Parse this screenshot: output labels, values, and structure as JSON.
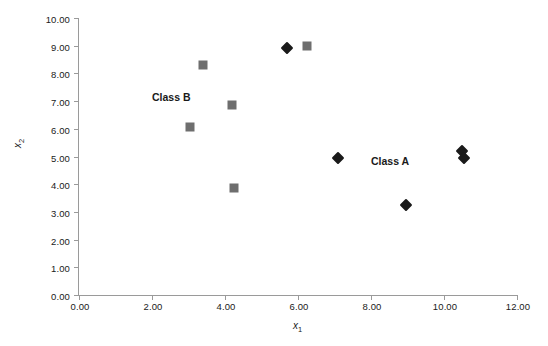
{
  "chart_data": {
    "type": "scatter",
    "title": "",
    "xlabel": "x1",
    "ylabel": "x2",
    "xlim": [
      0,
      12
    ],
    "ylim": [
      0,
      10
    ],
    "grid": false,
    "legend_position": "inline-annotations",
    "xticks": [
      "0.00",
      "2.00",
      "4.00",
      "6.00",
      "8.00",
      "10.00",
      "12.00"
    ],
    "xtick_values": [
      0,
      2,
      4,
      6,
      8,
      10,
      12
    ],
    "yticks": [
      "0.00",
      "1.00",
      "2.00",
      "3.00",
      "4.00",
      "5.00",
      "6.00",
      "7.00",
      "8.00",
      "9.00",
      "10.00"
    ],
    "ytick_values": [
      0,
      1,
      2,
      3,
      4,
      5,
      6,
      7,
      8,
      9,
      10
    ],
    "series": [
      {
        "name": "Class A",
        "marker": "diamond",
        "color": "#1a1a1a",
        "points": [
          {
            "x": 5.7,
            "y": 8.9
          },
          {
            "x": 7.1,
            "y": 4.95
          },
          {
            "x": 8.95,
            "y": 3.25
          },
          {
            "x": 10.5,
            "y": 5.2
          },
          {
            "x": 10.55,
            "y": 4.95
          }
        ]
      },
      {
        "name": "Class B",
        "marker": "square",
        "color": "#6e6e6e",
        "points": [
          {
            "x": 3.4,
            "y": 8.3
          },
          {
            "x": 6.25,
            "y": 9.0
          },
          {
            "x": 4.2,
            "y": 6.85
          },
          {
            "x": 3.05,
            "y": 6.05
          },
          {
            "x": 4.25,
            "y": 3.85
          }
        ]
      }
    ],
    "annotations": [
      {
        "text": "Class B",
        "x": 2.0,
        "y": 7.35
      },
      {
        "text": "Class A",
        "x": 8.0,
        "y": 5.05
      }
    ]
  },
  "axis": {
    "x_title_base": "x",
    "x_title_sub": "1",
    "y_title_base": "x",
    "y_title_sub": "2"
  }
}
